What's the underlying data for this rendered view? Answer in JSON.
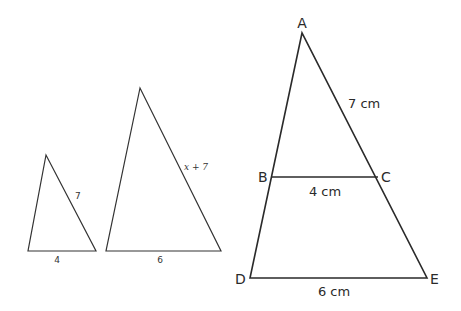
{
  "figure": {
    "small_triangle": {
      "side_label": "7",
      "base_label": "4"
    },
    "medium_triangle": {
      "side_label": "x + 7",
      "base_label": "6"
    },
    "large_triangle": {
      "vertices": {
        "top": "A",
        "mid_left": "B",
        "mid_right": "C",
        "bottom_left": "D",
        "bottom_right": "E"
      },
      "ac_label": "7 cm",
      "bc_label": "4 cm",
      "de_label": "6 cm"
    }
  }
}
